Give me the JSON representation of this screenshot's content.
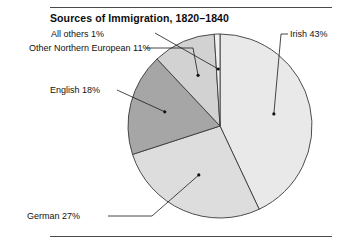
{
  "figure": {
    "title": "Sources of Immigration, 1820–1840",
    "background_color": "#ffffff",
    "rule_color": "#4a4a4a"
  },
  "chart_data": {
    "type": "pie",
    "title": "Sources of Immigration, 1820–1840",
    "xlabel": "",
    "ylabel": "",
    "legend_position": "none",
    "grid": false,
    "categories": [
      "Irish",
      "German",
      "English",
      "Other Northern European",
      "All others"
    ],
    "values": [
      43,
      27,
      18,
      11,
      1
    ],
    "unit": "%",
    "labels": [
      "Irish 43%",
      "German 27%",
      "English 18%",
      "Other Northern European 11%",
      "All others 1%"
    ],
    "slice_colors": [
      "#e9e9e9",
      "#dddddd",
      "#a6a6a6",
      "#d2d2d2",
      "#f2f2f2"
    ],
    "start_angle_deg": 0,
    "direction": "clockwise",
    "center": {
      "x": 220,
      "y": 126
    },
    "radius": 92,
    "outline_color": "#3a3a3a"
  },
  "labels": {
    "all_others": "All others 1%",
    "other_northern_european": "Other Northern European 11%",
    "english": "English 18%",
    "german": "German 27%",
    "irish": "Irish 43%"
  }
}
